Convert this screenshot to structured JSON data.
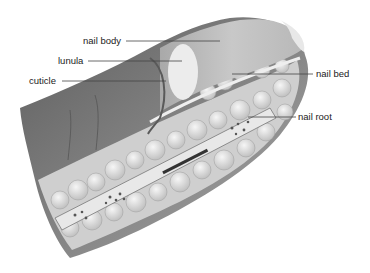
{
  "figure": {
    "labels": [
      {
        "id": "nail-body",
        "text": "nail body"
      },
      {
        "id": "lunula",
        "text": "lunula"
      },
      {
        "id": "cuticle",
        "text": "cuticle"
      },
      {
        "id": "nail-bed",
        "text": "nail bed"
      },
      {
        "id": "nail-root",
        "text": "nail root"
      }
    ]
  },
  "colors": {
    "skin_dark": "#6e6e6e",
    "skin_mid": "#9a9a9a",
    "nail": "#c4c4c4",
    "lunula": "#ececec",
    "fat": "#d8d8d8",
    "bone": "#e6e6e6",
    "leader": "#444444"
  }
}
